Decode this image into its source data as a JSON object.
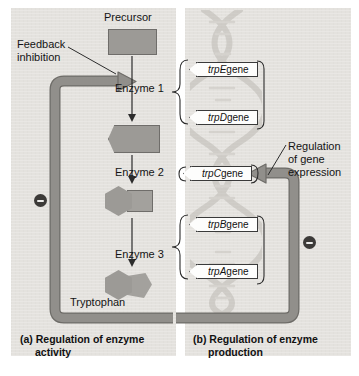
{
  "figure": {
    "colors": {
      "panel_background": "#e4e2de",
      "shape_fill": "#9c9a96",
      "shape_stroke": "#6f6d6a",
      "regulation_arrow": "#8c8a86",
      "regulation_arrow_stroke": "#6e6c68",
      "gene_box_fill": "#fdfdfc",
      "gene_box_stroke": "#3a3a3a",
      "minus_badge": "#3c3a38",
      "text": "#141414",
      "dna_helix": "#bdbab4"
    }
  },
  "panel_a": {
    "caption_prefix": "(a) Regulation of enzyme",
    "caption_line2": "activity",
    "feedback_label_line1": "Feedback",
    "feedback_label_line2": "inhibition",
    "pathway": {
      "precursor_label": "Precursor",
      "enzyme_1_label": "Enzyme 1",
      "enzyme_2_label": "Enzyme 2",
      "enzyme_3_label": "Enzyme 3",
      "product_label": "Tryptophan"
    },
    "minus_sign": "−"
  },
  "panel_b": {
    "caption_prefix": "(b) Regulation of enzyme",
    "caption_line2": "production",
    "regulation_label_line1": "Regulation",
    "regulation_label_line2": "of gene",
    "regulation_label_line3": "expression",
    "genes": [
      {
        "italic": "trpE",
        "suffix": " gene"
      },
      {
        "italic": "trpD",
        "suffix": " gene"
      },
      {
        "italic": "trpC",
        "suffix": " gene"
      },
      {
        "italic": "trpB",
        "suffix": " gene"
      },
      {
        "italic": "trpA",
        "suffix": " gene"
      }
    ],
    "minus_sign": "−"
  }
}
